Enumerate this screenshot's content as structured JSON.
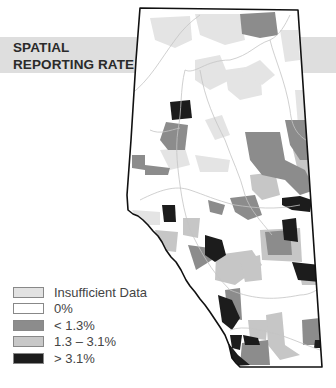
{
  "title": {
    "line1": "SPATIAL",
    "line2": "REPORTING RATE"
  },
  "map": {
    "region": "Alberta",
    "outline_color": "#111111",
    "river_color": "#c8c8c8"
  },
  "legend": {
    "items": [
      {
        "label": "Insufficient Data",
        "color": "#e2e2e2"
      },
      {
        "label": "0%",
        "color": "#ffffff"
      },
      {
        "label": "< 1.3%",
        "color": "#8c8c8c"
      },
      {
        "label": "1.3 – 3.1%",
        "color": "#c8c8c8"
      },
      {
        "label": "> 3.1%",
        "color": "#1c1c1c"
      }
    ]
  }
}
